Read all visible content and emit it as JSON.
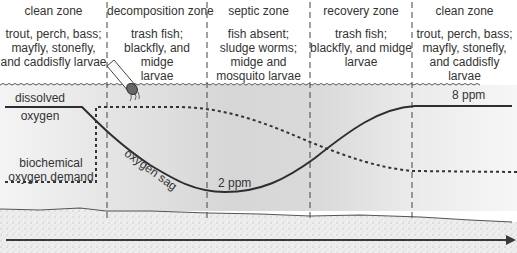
{
  "diagram": {
    "zones": [
      {
        "title": "clean zone",
        "desc": [
          "trout, perch, bass;",
          "mayfly, stonefly,",
          "and caddisfly larvae"
        ]
      },
      {
        "title": "decomposition zone",
        "desc": [
          "trash fish;",
          "blackfly, and midge",
          "larvae"
        ]
      },
      {
        "title": "septic zone",
        "desc": [
          "fish absent;",
          "sludge worms;",
          "midge and",
          "mosquito larvae"
        ]
      },
      {
        "title": "recovery zone",
        "desc": [
          "trash fish;",
          "blackfly, and midge",
          "larvae"
        ]
      },
      {
        "title": "clean zone",
        "desc": [
          "trout, perch, bass;",
          "mayfly, stonefly,",
          "and caddisfly larvae"
        ]
      }
    ],
    "curves": {
      "dissolved_oxygen_label_1": "dissolved",
      "dissolved_oxygen_label_2": "oxygen",
      "bod_label_1": "biochemical",
      "bod_label_2": "oxygen demand",
      "sag_label": "oxygen sag",
      "min_label": "2 ppm",
      "max_label": "8 ppm"
    },
    "icons": {
      "pipe": "sewage-outfall-pipe",
      "flow_arrow": "river-flow-arrow"
    },
    "colors": {
      "water_shade": "#dcdcdc",
      "sediment": "#ececec",
      "line": "#2e2e2e"
    }
  }
}
